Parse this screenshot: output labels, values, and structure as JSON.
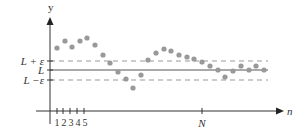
{
  "chart_data": {
    "type": "scatter",
    "title": "",
    "xlabel": "n",
    "ylabel": "y",
    "x_tick_labels": [
      "1",
      "2",
      "3",
      "4",
      "5",
      "N"
    ],
    "y_tick_labels": [
      "L + ε",
      "L",
      "L − ε"
    ],
    "reference_lines": [
      {
        "name": "L + ε",
        "style": "dashed",
        "y_px": 61
      },
      {
        "name": "L",
        "style": "solid",
        "y_px": 70
      },
      {
        "name": "L − ε",
        "style": "dashed",
        "y_px": 80
      }
    ],
    "points_px": [
      [
        57,
        48
      ],
      [
        65,
        41
      ],
      [
        72,
        47
      ],
      [
        80,
        41
      ],
      [
        87,
        38
      ],
      [
        95,
        45
      ],
      [
        103,
        55
      ],
      [
        110,
        63
      ],
      [
        118,
        72
      ],
      [
        126,
        79
      ],
      [
        133,
        88
      ],
      [
        141,
        75
      ],
      [
        148,
        60
      ],
      [
        156,
        53
      ],
      [
        164,
        49
      ],
      [
        171,
        51
      ],
      [
        179,
        55
      ],
      [
        187,
        57
      ],
      [
        194,
        59
      ],
      [
        202,
        62
      ],
      [
        210,
        66
      ],
      [
        218,
        70
      ],
      [
        225,
        77
      ],
      [
        233,
        71
      ],
      [
        241,
        66
      ],
      [
        249,
        70
      ],
      [
        256,
        66
      ],
      [
        264,
        70
      ]
    ],
    "grid": false,
    "legend": null
  },
  "labels": {
    "y_axis": "y",
    "x_axis": "n",
    "l_plus_eps": "L + ε",
    "l": "L",
    "l_minus_eps": "L −ε",
    "tick_1": "1",
    "tick_2": "2",
    "tick_3": "3",
    "tick_4": "4",
    "tick_5": "5",
    "tick_n": "N"
  },
  "colors": {
    "axis": "#333333",
    "dots": "#999999",
    "dashed": "#999999",
    "limit_line": "#555555"
  }
}
